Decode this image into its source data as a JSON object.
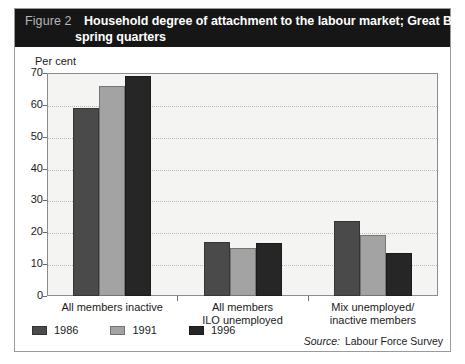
{
  "figure": {
    "number_label": "Figure 2",
    "title_line_1": "Household degree of attachment to the labour market; Great Britain;",
    "title_line_2": "spring quarters",
    "banner_color": "#161616",
    "number_color": "#b6b6b6",
    "title_color": "#ffffff"
  },
  "source": {
    "key": "Source:",
    "value": "Labour Force Survey"
  },
  "legend": {
    "items": [
      {
        "label": "1986",
        "color": "#4a4a4a"
      },
      {
        "label": "1991",
        "color": "#a3a3a3"
      },
      {
        "label": "1996",
        "color": "#262626"
      }
    ]
  },
  "axis": {
    "unit_label": "Per cent",
    "ticks": [
      "70",
      "60",
      "50",
      "40",
      "30",
      "20",
      "10",
      "0"
    ]
  },
  "chart_data": {
    "type": "bar",
    "title": "Household degree of attachment to the labour market; Great Britain; spring quarters",
    "xlabel": "",
    "ylabel": "Per cent",
    "ylim": [
      0,
      70
    ],
    "ytick_step": 10,
    "grid": true,
    "legend_position": "bottom-left",
    "categories": [
      "All members inactive",
      "All members ILO unemployed",
      "Mix unemployed/ inactive members"
    ],
    "category_lines": [
      [
        "All members inactive"
      ],
      [
        "All members",
        "ILO unemployed"
      ],
      [
        "Mix unemployed/",
        "inactive members"
      ]
    ],
    "series": [
      {
        "name": "1986",
        "color": "#4a4a4a",
        "values": [
          59,
          17,
          23.5
        ]
      },
      {
        "name": "1991",
        "color": "#a3a3a3",
        "values": [
          66,
          15,
          19
        ]
      },
      {
        "name": "1996",
        "color": "#262626",
        "values": [
          69,
          16.5,
          13.5
        ]
      }
    ]
  }
}
